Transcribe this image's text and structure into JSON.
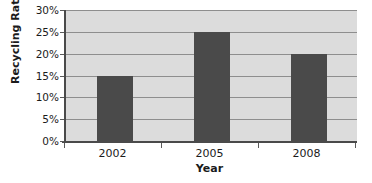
{
  "chart_data": {
    "type": "bar",
    "title": "",
    "categories": [
      "2002",
      "2005",
      "2008"
    ],
    "values": [
      15,
      25,
      20
    ],
    "series": [
      {
        "name": "Recycling Rate",
        "values": [
          15,
          25,
          20
        ]
      }
    ],
    "xlabel": "Year",
    "ylabel": "Recycling Rate",
    "ylim": [
      0,
      30
    ],
    "ytick_values": [
      0,
      5,
      10,
      15,
      20,
      25,
      30
    ],
    "ytick_labels": [
      "0%",
      "5%",
      "10%",
      "15%",
      "20%",
      "25%",
      "30%"
    ],
    "ytick_step": 5,
    "value_suffix": "%",
    "grid": true,
    "grid_axis": "y",
    "legend": false,
    "legend_position": "none",
    "colors": {
      "bar_fill": "#4a4a4a",
      "plot_background": "#dcdcdc",
      "gridline": "#8e8e8e",
      "axis_line": "#4a4a4a",
      "text": "#1b1b1b",
      "page_background": "#ffffff"
    }
  }
}
